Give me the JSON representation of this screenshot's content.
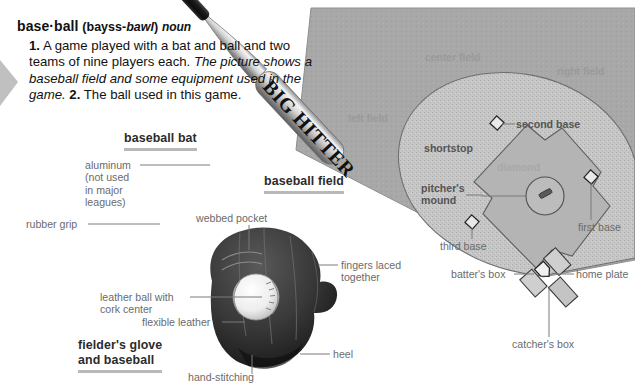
{
  "entry": {
    "headword": "base·ball",
    "pron_open": "(bayss-",
    "pron_italic": "bawl",
    "pron_close": ")",
    "part_of_speech": "noun",
    "sense1_num": "1.",
    "sense1_text": "A game played with a bat and ball and two teams of nine players each.",
    "sense1_usage": "The picture shows a baseball field and some equipment used in the game.",
    "sense2_num": "2.",
    "sense2_text": "The ball used in this game."
  },
  "captions": {
    "bat": "baseball bat",
    "field": "baseball field",
    "glove_line1": "fielder's glove",
    "glove_line2": "and baseball"
  },
  "bat": {
    "brand": "BIG HITTER",
    "label_aluminum_line1": "aluminum",
    "label_aluminum_line2": "(not used",
    "label_aluminum_line3": "in major",
    "label_aluminum_line4": "leagues)",
    "label_grip": "rubber grip"
  },
  "glove": {
    "label_webbed_pocket": "webbed pocket",
    "label_fingers_line1": "fingers laced",
    "label_fingers_line2": "together",
    "label_leather_ball_line1": "leather ball with",
    "label_leather_ball_line2": "cork center",
    "label_flexible_leather": "flexible leather",
    "label_hand_stitching": "hand-stitching",
    "label_heel": "heel"
  },
  "field": {
    "center_field": "center field",
    "right_field": "right field",
    "left_field": "left field",
    "second_base": "second base",
    "shortstop": "shortstop",
    "diamond": "diamond",
    "pitchers_mound_line1": "pitcher's",
    "pitchers_mound_line2": "mound",
    "third_base": "third base",
    "first_base": "first base",
    "batters_box": "batter's box",
    "home_plate": "home plate",
    "catchers_box": "catcher's box"
  },
  "colors": {
    "outfield_grass": "#a8a8a8",
    "infield_dirt": "#c6c6c6",
    "diamond_grass": "#b4b4b4",
    "caption_underline": "#b9b9b9",
    "leader_line": "#7b7b7b",
    "label_text": "#6b6b6b",
    "body_text": "#111111"
  }
}
